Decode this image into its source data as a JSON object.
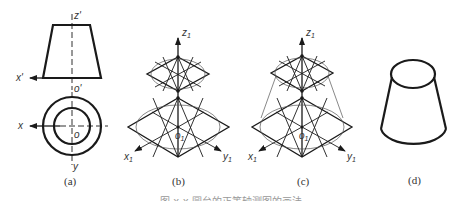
{
  "figure": {
    "panels": [
      {
        "id": "a",
        "label": "(a)",
        "description": "orthographic views of truncated cone (frustum)",
        "axis_labels": {
          "z": "z",
          "z_prime": "'",
          "x_front": "x",
          "x_front_prime": "'",
          "o_front": "o",
          "o_front_prime": "'",
          "x_top": "x",
          "o_top": "o",
          "y_top": "y"
        }
      },
      {
        "id": "b",
        "label": "(b)",
        "description": "isometric rhombi with four-center ellipse construction",
        "axis_labels": {
          "z": "z",
          "z_sub": "1",
          "x": "x",
          "x_sub": "1",
          "y": "y",
          "y_sub": "1",
          "o": "o",
          "o_sub": "1"
        }
      },
      {
        "id": "c",
        "label": "(c)",
        "description": "ellipses with tangent outline lines",
        "axis_labels": {
          "z": "z",
          "z_sub": "1",
          "x": "x",
          "x_sub": "1",
          "y": "y",
          "y_sub": "1",
          "o": "o",
          "o_sub": "1"
        }
      },
      {
        "id": "d",
        "label": "(d)",
        "description": "finished isometric frustum"
      }
    ],
    "caption": "图 x-x 圆台的正等轴测图的画法"
  }
}
